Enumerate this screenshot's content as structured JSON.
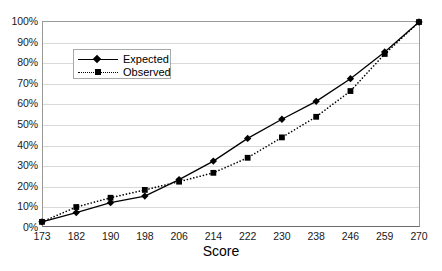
{
  "chart_data": {
    "type": "line",
    "title": "",
    "xlabel": "Score",
    "ylabel": "",
    "categories": [
      "173",
      "182",
      "190",
      "198",
      "206",
      "214",
      "222",
      "230",
      "238",
      "246",
      "259",
      "270"
    ],
    "ytick_labels": [
      "100%",
      "90%",
      "80%",
      "70%",
      "60%",
      "50%",
      "40%",
      "30%",
      "20%",
      "10%",
      "0%"
    ],
    "ylim": [
      0,
      100
    ],
    "ytick_step": 10,
    "grid": "horizontal",
    "legend_position": "upper-left-inside",
    "series": [
      {
        "name": "Expected",
        "marker": "diamond",
        "line_style": "solid",
        "color": "#000000",
        "values": [
          2.5,
          7.0,
          11.8,
          15.0,
          23.0,
          32.0,
          43.0,
          52.3,
          61.0,
          72.0,
          85.0,
          99.5
        ]
      },
      {
        "name": "Observed",
        "marker": "square",
        "line_style": "dotted",
        "color": "#000000",
        "values": [
          2.5,
          9.7,
          14.2,
          18.0,
          22.0,
          26.3,
          33.6,
          43.5,
          53.5,
          66.0,
          84.0,
          99.5
        ]
      }
    ]
  }
}
